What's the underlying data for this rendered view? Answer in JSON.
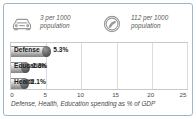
{
  "panel": {
    "border_color": "#9fb6cd",
    "background": "#ffffff"
  },
  "stats": [
    {
      "icon": "car-icon",
      "value_line1": "3 per 1000",
      "value_line2": "population"
    },
    {
      "icon": "telephone-circle-icon",
      "value_line1": "112 per 1000",
      "value_line2": "population"
    }
  ],
  "chart_data": {
    "type": "bar",
    "orientation": "horizontal",
    "title": "",
    "caption": "Defense, Health, Education spending as % of GDP",
    "categories": [
      "Defense",
      "Education",
      "Health"
    ],
    "values": [
      5.3,
      2.3,
      2.1
    ],
    "value_labels": [
      "5.3%",
      "2.3%",
      "2.1%"
    ],
    "xlabel": "",
    "ylabel": "",
    "xlim": [
      0,
      25
    ],
    "xticks": [
      0,
      5,
      10,
      15,
      20,
      25
    ],
    "xtick_labels": [
      "0",
      "5",
      "10",
      "15",
      "20",
      "25"
    ],
    "grid": true,
    "legend": false,
    "bar_color": "#b4b4b4",
    "bar_edge_color": "#8c8c8c"
  }
}
